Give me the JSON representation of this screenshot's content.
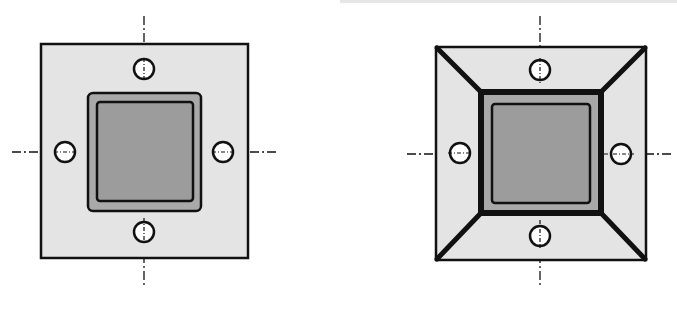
{
  "diagram": {
    "colors": {
      "plate_fill": "#e4e4e4",
      "frame_fill": "#a9a9a9",
      "core_fill": "#9c9c9c",
      "stroke": "#111111",
      "hole_fill": "#ffffff"
    },
    "left_view": {
      "label": "plate-with-square-column",
      "holes": 4
    },
    "right_view": {
      "label": "plate-with-tapered-stiffener-frame",
      "holes": 4
    }
  }
}
